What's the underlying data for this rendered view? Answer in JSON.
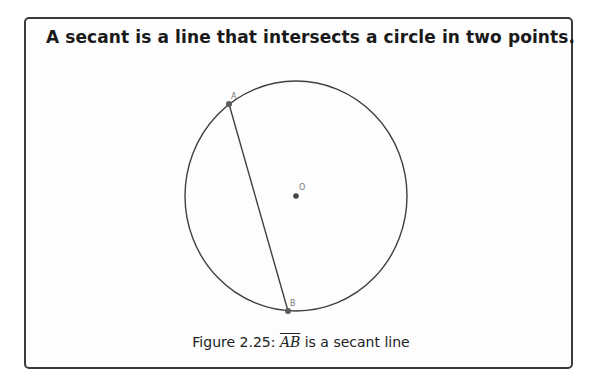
{
  "heading": "A secant is a line that intersects a circle in two points.",
  "figure": {
    "points": [
      {
        "label": "A",
        "x": 229,
        "y": 104
      },
      {
        "label": "B",
        "x": 288,
        "y": 311
      },
      {
        "label": "O",
        "x": 296,
        "y": 196
      }
    ],
    "circle": {
      "cx": 296,
      "cy": 196,
      "rx": 111,
      "ry": 115
    },
    "segment": {
      "from": "A",
      "to": "B"
    }
  },
  "caption": {
    "prefix": "Figure 2.25: ",
    "math": "AB",
    "suffix": " is a secant line"
  },
  "colors": {
    "stroke": "#404040",
    "point": "#555555",
    "label": "#666666"
  }
}
